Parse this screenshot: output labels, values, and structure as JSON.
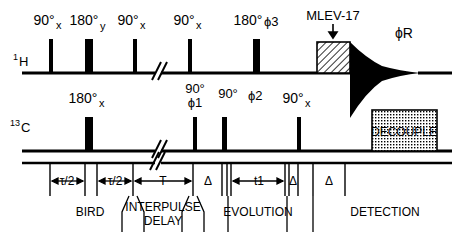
{
  "figure": {
    "type": "nmr-pulse-sequence-diagram",
    "channels": [
      {
        "id": "proton",
        "label_main": "1",
        "label_nucleus": "H",
        "baseline_y": 73
      },
      {
        "id": "carbon",
        "label_main": "13",
        "label_nucleus": "C",
        "baseline_y": 151
      }
    ],
    "proton_pulses": [
      {
        "name": "pulse-90x-a",
        "angle": "90°",
        "phase": "x",
        "x": 49,
        "width": 4,
        "height": 34
      },
      {
        "name": "pulse-180y",
        "angle": "180°",
        "phase": "y",
        "x": 85,
        "width": 8,
        "height": 34
      },
      {
        "name": "pulse-90x-b",
        "angle": "90°",
        "phase": "x",
        "x": 133,
        "width": 4,
        "height": 34
      },
      {
        "name": "pulse-90x-c",
        "angle": "90°",
        "phase": "x",
        "x": 188,
        "width": 4,
        "height": 34
      },
      {
        "name": "pulse-180-phi3",
        "angle": "180°",
        "phase": "ϕ3",
        "x": 253,
        "width": 7,
        "height": 34
      }
    ],
    "carbon_pulses": [
      {
        "name": "pulse-180x",
        "angle": "180°",
        "phase": "x",
        "x": 85,
        "width": 8,
        "height": 34
      },
      {
        "name": "pulse-90-phi1",
        "angle": "90°",
        "phase": "ϕ1",
        "x": 193,
        "width": 4,
        "height": 34
      },
      {
        "name": "pulse-90-phi2",
        "angle": "90°",
        "phase": "ϕ2",
        "x": 222,
        "width": 5,
        "height": 34
      },
      {
        "name": "pulse-90x-d",
        "angle": "90°",
        "phase": "x",
        "x": 297,
        "width": 4,
        "height": 34
      }
    ],
    "blocks": [
      {
        "name": "mlev-17-block",
        "label": "MLEV-17",
        "fill": "hatched",
        "x": 317,
        "y": 42,
        "w": 33,
        "h": 31,
        "channel": "proton"
      },
      {
        "name": "decouple-block",
        "label": "DECOUPLE",
        "fill": "stippled",
        "x": 372,
        "y": 110,
        "w": 65,
        "h": 41,
        "channel": "carbon"
      }
    ],
    "fid": {
      "name": "fid-signal",
      "label": "ϕR",
      "start_x": 350,
      "end_x": 420,
      "channel": "proton"
    },
    "breaks": [
      {
        "name": "timeline-break-proton",
        "x": 158,
        "channel": "proton"
      },
      {
        "name": "timeline-break-carbon",
        "x": 158,
        "channel": "carbon"
      },
      {
        "name": "timeline-break-axis",
        "x": 158,
        "channel": "axis"
      }
    ],
    "interval_labels": [
      {
        "name": "interval-tau-half-1",
        "text": "τ/2",
        "x": 67
      },
      {
        "name": "interval-tau-half-2",
        "text": "τ/2",
        "x": 115
      },
      {
        "name": "interval-T",
        "text": "T",
        "x": 163
      },
      {
        "name": "interval-delta-1",
        "text": "Δ",
        "x": 208
      },
      {
        "name": "interval-t1",
        "text": "t1",
        "x": 259
      },
      {
        "name": "interval-delta-2",
        "text": "Δ",
        "x": 291
      },
      {
        "name": "interval-delta-3",
        "text": "Δ",
        "x": 330
      }
    ],
    "period_labels": [
      {
        "name": "period-bird",
        "text": "BIRD",
        "x": 90
      },
      {
        "name": "period-interpulse-delay-line1",
        "text": "INTERPULSE",
        "x": 163
      },
      {
        "name": "period-interpulse-delay-line2",
        "text": "DELAY",
        "x": 163
      },
      {
        "name": "period-evolution",
        "text": "EVOLUTION",
        "x": 258
      },
      {
        "name": "period-detection",
        "text": "DETECTION",
        "x": 385
      }
    ],
    "axis": {
      "name": "timing-axis",
      "y": 163,
      "start_x": 22,
      "end_x": 452,
      "ticks": [
        50,
        85,
        97,
        133,
        193,
        222,
        227,
        231,
        285,
        289,
        298,
        313,
        345,
        351
      ]
    }
  }
}
